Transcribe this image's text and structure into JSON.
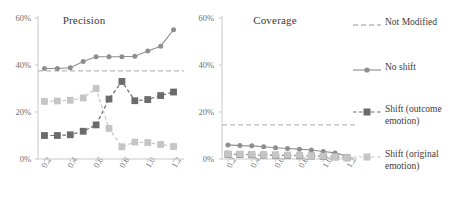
{
  "figure": {
    "background": "#ffffff",
    "xlabel": "",
    "ylabel": ""
  },
  "panels": {
    "precision": {
      "title": "Precision"
    },
    "coverage": {
      "title": "Coverage"
    }
  },
  "axes": {
    "yticks": [
      "0%",
      "20%",
      "40%",
      "60%"
    ],
    "xticks": [
      "0.2",
      "0.4",
      "0.6",
      "0.8",
      "1.0",
      "1.2"
    ],
    "ylim": [
      0,
      60
    ],
    "xlim": [
      0.15,
      1.25
    ]
  },
  "legend": {
    "position": "right",
    "items": [
      {
        "label": "Not Modified",
        "color": "#b9b9b9",
        "style": "dashed",
        "marker": "none"
      },
      {
        "label": "No shift",
        "color": "#8e8e8e",
        "style": "solid",
        "marker": "circle"
      },
      {
        "label": "Shift (outcome emotion)",
        "color": "#6b6b6b",
        "style": "dashed",
        "marker": "square"
      },
      {
        "label": "Shift (original emotion)",
        "color": "#c5c5c5",
        "style": "dashed",
        "marker": "square"
      }
    ]
  },
  "colors": {
    "not_modified": "#b9b9b9",
    "no_shift": "#8e8e8e",
    "shift_outcome": "#6b6b6b",
    "shift_original": "#c5c5c5",
    "axis": "#c9c9c9",
    "text": "#3d3d3d"
  },
  "chart_data": [
    {
      "type": "line",
      "title": "Precision",
      "xlabel": "",
      "ylabel": "",
      "xlim": [
        0.15,
        1.25
      ],
      "ylim": [
        0,
        60
      ],
      "yticks": [
        0,
        20,
        40,
        60
      ],
      "ytick_labels": [
        "0%",
        "20%",
        "40%",
        "60%"
      ],
      "xticks": [
        0.2,
        0.4,
        0.6,
        0.8,
        1.0,
        1.2
      ],
      "xtick_labels": [
        "0.2",
        "0.4",
        "0.6",
        "0.8",
        "1.0",
        "1.2"
      ],
      "grid": false,
      "legend_position": "right",
      "x": [
        0.2,
        0.3,
        0.4,
        0.5,
        0.6,
        0.7,
        0.8,
        0.9,
        1.0,
        1.1,
        1.2
      ],
      "series": [
        {
          "name": "Not Modified",
          "type": "hline",
          "value": 37.5,
          "values": [
            37.5,
            37.5,
            37.5,
            37.5,
            37.5,
            37.5,
            37.5,
            37.5,
            37.5,
            37.5,
            37.5
          ]
        },
        {
          "name": "No shift",
          "values": [
            38.5,
            38.5,
            38.8,
            41.5,
            43.5,
            43.5,
            43.5,
            43.7,
            46.0,
            48.0,
            55.0
          ]
        },
        {
          "name": "Shift (outcome emotion)",
          "values": [
            10.0,
            10.0,
            10.3,
            11.8,
            14.5,
            25.5,
            33.0,
            24.8,
            25.3,
            27.0,
            28.5
          ]
        },
        {
          "name": "Shift (original emotion)",
          "values": [
            24.5,
            24.7,
            25.0,
            26.0,
            30.0,
            13.0,
            5.2,
            7.2,
            7.0,
            6.2,
            5.3
          ]
        }
      ]
    },
    {
      "type": "line",
      "title": "Coverage",
      "xlabel": "",
      "ylabel": "",
      "xlim": [
        0.15,
        1.25
      ],
      "ylim": [
        0,
        60
      ],
      "yticks": [
        0,
        20,
        40,
        60
      ],
      "ytick_labels": [
        "0%",
        "20%",
        "40%",
        "60%"
      ],
      "xticks": [
        0.2,
        0.4,
        0.6,
        0.8,
        1.0,
        1.2
      ],
      "xtick_labels": [
        "0.2",
        "0.4",
        "0.6",
        "0.8",
        "1.0",
        "1.2"
      ],
      "grid": false,
      "legend_position": "right",
      "x": [
        0.2,
        0.3,
        0.4,
        0.5,
        0.6,
        0.7,
        0.8,
        0.9,
        1.0,
        1.1,
        1.2
      ],
      "series": [
        {
          "name": "Not Modified",
          "type": "hline",
          "value": 14.5,
          "values": [
            14.5,
            14.5,
            14.5,
            14.5,
            14.5,
            14.5,
            14.5,
            14.5,
            14.5,
            14.5,
            14.5
          ]
        },
        {
          "name": "No shift",
          "values": [
            6.0,
            5.7,
            5.6,
            5.2,
            4.8,
            4.5,
            4.2,
            3.8,
            3.2,
            2.6,
            1.2
          ]
        },
        {
          "name": "Shift (outcome emotion)",
          "values": [
            2.0,
            1.9,
            1.8,
            1.7,
            1.6,
            1.5,
            1.4,
            1.3,
            1.1,
            0.9,
            0.5
          ]
        },
        {
          "name": "Shift (original emotion)",
          "values": [
            2.2,
            2.1,
            2.0,
            1.9,
            1.8,
            1.7,
            1.6,
            1.4,
            1.2,
            1.0,
            0.6
          ]
        }
      ]
    }
  ]
}
